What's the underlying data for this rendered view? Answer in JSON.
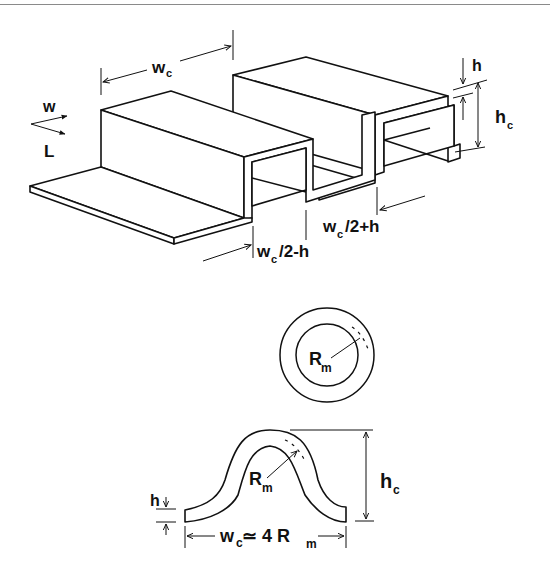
{
  "figure": {
    "top_diagram": {
      "description": "Isometric view of corrugated (square-wave) strip",
      "labels": {
        "wc_top": "w",
        "wc_top_sub": "c",
        "axis_w": "w",
        "axis_L": "L",
        "h": "h",
        "hc": "h",
        "hc_sub": "c",
        "wc_half_plus_h_main": "w",
        "wc_half_plus_h_sub": "c",
        "wc_half_plus_h_tail": "/2+h",
        "wc_half_minus_h_main": "w",
        "wc_half_minus_h_sub": "c",
        "wc_half_minus_h_tail": "/2-h"
      }
    },
    "ring_diagram": {
      "description": "Ring cross-section with mean radius",
      "labels": {
        "Rm": "R",
        "Rm_sub": "m"
      }
    },
    "arch_diagram": {
      "description": "Arched corrugation cross-section",
      "labels": {
        "Rm": "R",
        "Rm_sub": "m",
        "h": "h",
        "hc": "h",
        "hc_sub": "c",
        "width_main": "w",
        "width_sub": "c",
        "width_eq": " ≃ 4 R",
        "width_eq_sub": "m"
      }
    }
  }
}
